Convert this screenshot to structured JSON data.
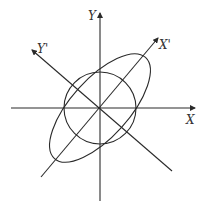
{
  "diagram": {
    "type": "coordinate-rotation",
    "labels": {
      "x_axis": "X",
      "y_axis": "Y",
      "x_prime_axis": "X'",
      "y_prime_axis": "Y'"
    },
    "shapes": {
      "circle": {
        "description": "circle centered at origin"
      },
      "ellipse": {
        "description": "ellipse centered at origin, major axis along X'"
      }
    },
    "colors": {
      "stroke": "#2a2a2a",
      "label": "#333333",
      "background": "#ffffff"
    }
  }
}
